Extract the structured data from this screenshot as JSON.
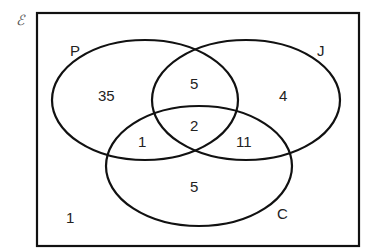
{
  "diagram": {
    "type": "venn",
    "universal_symbol": "ℰ",
    "sets": [
      {
        "name": "P",
        "label": "P"
      },
      {
        "name": "J",
        "label": "J"
      },
      {
        "name": "C",
        "label": "C"
      }
    ],
    "regions": {
      "P_only": "35",
      "J_only": "4",
      "C_only": "5",
      "P_and_J_only": "5",
      "P_and_C_only": "1",
      "J_and_C_only": "11",
      "P_and_J_and_C": "2",
      "outside": "1"
    }
  }
}
